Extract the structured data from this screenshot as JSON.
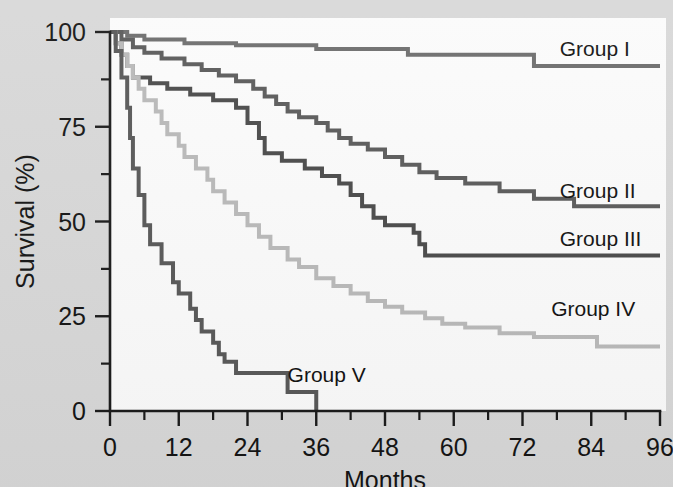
{
  "figure": {
    "background_color": "#d8d8d8",
    "plot_background_color": "#fbfbfb",
    "axis_color": "#1a1a1a"
  },
  "chart_data": {
    "type": "line",
    "subtype": "kaplan-meier-step",
    "title": "",
    "xlabel": "Months",
    "ylabel": "Survival (%)",
    "xlim": [
      0,
      96
    ],
    "ylim": [
      0,
      100
    ],
    "grid": false,
    "legend_position": "inline-right",
    "x_ticks_major": [
      0,
      12,
      24,
      36,
      48,
      60,
      72,
      84,
      96
    ],
    "x_ticks_minor": [
      6,
      18,
      30,
      42,
      54,
      66,
      78,
      90
    ],
    "y_ticks_major": [
      0,
      25,
      50,
      75,
      100
    ],
    "y_ticks_minor": [
      12.5,
      37.5,
      62.5,
      87.5
    ],
    "x_tick_labels": [
      "0",
      "12",
      "24",
      "36",
      "48",
      "60",
      "72",
      "84",
      "96"
    ],
    "y_tick_labels": [
      "0",
      "25",
      "50",
      "75",
      "100"
    ],
    "series": [
      {
        "name": "Group I",
        "label": "Group I",
        "color": "#6d6d6d",
        "line_width": 4.0,
        "label_x": 78.5,
        "label_y": 95.5,
        "final_value": 91,
        "points": [
          [
            0,
            100
          ],
          [
            3,
            100
          ],
          [
            3,
            99
          ],
          [
            6,
            99
          ],
          [
            6,
            98
          ],
          [
            13,
            98
          ],
          [
            13,
            97
          ],
          [
            22,
            97
          ],
          [
            22,
            96.5
          ],
          [
            36,
            96.5
          ],
          [
            36,
            95.5
          ],
          [
            52,
            95.5
          ],
          [
            52,
            94
          ],
          [
            74,
            94
          ],
          [
            74,
            91
          ],
          [
            96,
            91
          ]
        ]
      },
      {
        "name": "Group II",
        "label": "Group II",
        "color": "#5a5a5a",
        "line_width": 4.0,
        "label_x": 78.5,
        "label_y": 58,
        "final_value": 54,
        "points": [
          [
            0,
            100
          ],
          [
            2,
            100
          ],
          [
            2,
            98
          ],
          [
            4,
            98
          ],
          [
            4,
            96
          ],
          [
            6,
            96
          ],
          [
            6,
            94.5
          ],
          [
            9,
            94.5
          ],
          [
            9,
            93
          ],
          [
            13,
            93
          ],
          [
            13,
            91.5
          ],
          [
            16,
            91.5
          ],
          [
            16,
            90
          ],
          [
            19,
            90
          ],
          [
            19,
            88.5
          ],
          [
            22,
            88.5
          ],
          [
            22,
            87
          ],
          [
            25,
            87
          ],
          [
            25,
            85
          ],
          [
            27,
            85
          ],
          [
            27,
            83
          ],
          [
            29,
            83
          ],
          [
            29,
            81
          ],
          [
            31,
            81
          ],
          [
            31,
            79
          ],
          [
            33,
            79
          ],
          [
            33,
            77.5
          ],
          [
            36,
            77.5
          ],
          [
            36,
            76
          ],
          [
            38,
            76
          ],
          [
            38,
            74
          ],
          [
            40,
            74
          ],
          [
            40,
            72
          ],
          [
            42,
            72
          ],
          [
            42,
            70.5
          ],
          [
            45,
            70.5
          ],
          [
            45,
            69
          ],
          [
            48,
            69
          ],
          [
            48,
            67
          ],
          [
            51,
            67
          ],
          [
            51,
            65
          ],
          [
            54,
            65
          ],
          [
            54,
            63
          ],
          [
            57,
            63
          ],
          [
            57,
            61.5
          ],
          [
            62,
            61.5
          ],
          [
            62,
            60
          ],
          [
            68,
            60
          ],
          [
            68,
            58
          ],
          [
            74,
            58
          ],
          [
            74,
            56
          ],
          [
            81,
            56
          ],
          [
            81,
            54
          ],
          [
            96,
            54
          ]
        ]
      },
      {
        "name": "Group III",
        "label": "Group III",
        "color": "#4a4a4a",
        "line_width": 4.0,
        "label_x": 78.5,
        "label_y": 45.5,
        "final_value": 41,
        "points": [
          [
            0,
            100
          ],
          [
            1,
            100
          ],
          [
            1,
            97
          ],
          [
            2,
            97
          ],
          [
            2,
            94
          ],
          [
            3,
            94
          ],
          [
            3,
            91
          ],
          [
            4,
            91
          ],
          [
            4,
            88
          ],
          [
            7,
            88
          ],
          [
            7,
            86.5
          ],
          [
            10,
            86.5
          ],
          [
            10,
            85
          ],
          [
            14,
            85
          ],
          [
            14,
            83.5
          ],
          [
            18,
            83.5
          ],
          [
            18,
            82
          ],
          [
            22,
            82
          ],
          [
            22,
            80
          ],
          [
            24,
            80
          ],
          [
            24,
            76
          ],
          [
            26,
            76
          ],
          [
            26,
            72
          ],
          [
            27,
            72
          ],
          [
            27,
            68
          ],
          [
            30,
            68
          ],
          [
            30,
            66
          ],
          [
            34,
            66
          ],
          [
            34,
            64
          ],
          [
            37,
            64
          ],
          [
            37,
            62
          ],
          [
            40,
            62
          ],
          [
            40,
            60
          ],
          [
            42,
            60
          ],
          [
            42,
            57
          ],
          [
            44,
            57
          ],
          [
            44,
            54
          ],
          [
            46,
            54
          ],
          [
            46,
            51
          ],
          [
            48,
            51
          ],
          [
            48,
            49
          ],
          [
            53,
            49
          ],
          [
            53,
            47
          ],
          [
            54,
            47
          ],
          [
            54,
            44
          ],
          [
            55,
            44
          ],
          [
            55,
            41
          ],
          [
            96,
            41
          ]
        ]
      },
      {
        "name": "Group IV",
        "label": "Group IV",
        "color": "#b9b9b9",
        "line_width": 4.0,
        "label_x": 77,
        "label_y": 27,
        "final_value": 17,
        "points": [
          [
            0,
            100
          ],
          [
            1,
            100
          ],
          [
            1,
            97
          ],
          [
            2,
            97
          ],
          [
            2,
            94
          ],
          [
            3,
            94
          ],
          [
            3,
            91
          ],
          [
            4,
            91
          ],
          [
            4,
            88
          ],
          [
            5,
            88
          ],
          [
            5,
            85
          ],
          [
            6,
            85
          ],
          [
            6,
            82
          ],
          [
            8,
            82
          ],
          [
            8,
            79
          ],
          [
            9,
            79
          ],
          [
            9,
            76
          ],
          [
            10,
            76
          ],
          [
            10,
            73
          ],
          [
            12,
            73
          ],
          [
            12,
            70
          ],
          [
            13,
            70
          ],
          [
            13,
            67
          ],
          [
            15,
            67
          ],
          [
            15,
            64
          ],
          [
            17,
            64
          ],
          [
            17,
            61
          ],
          [
            18,
            61
          ],
          [
            18,
            58
          ],
          [
            20,
            58
          ],
          [
            20,
            55
          ],
          [
            22,
            55
          ],
          [
            22,
            52
          ],
          [
            24,
            52
          ],
          [
            24,
            49
          ],
          [
            26,
            49
          ],
          [
            26,
            46
          ],
          [
            28,
            46
          ],
          [
            28,
            43
          ],
          [
            31,
            43
          ],
          [
            31,
            40
          ],
          [
            33,
            40
          ],
          [
            33,
            38
          ],
          [
            36,
            38
          ],
          [
            36,
            35
          ],
          [
            39,
            35
          ],
          [
            39,
            33
          ],
          [
            42,
            33
          ],
          [
            42,
            31
          ],
          [
            45,
            31
          ],
          [
            45,
            29
          ],
          [
            48,
            29
          ],
          [
            48,
            27.5
          ],
          [
            51,
            27.5
          ],
          [
            51,
            26
          ],
          [
            55,
            26
          ],
          [
            55,
            24.5
          ],
          [
            58,
            24.5
          ],
          [
            58,
            23
          ],
          [
            62,
            23
          ],
          [
            62,
            22
          ],
          [
            68,
            22
          ],
          [
            68,
            20.5
          ],
          [
            74,
            20.5
          ],
          [
            74,
            19.5
          ],
          [
            85,
            19.5
          ],
          [
            85,
            17
          ],
          [
            96,
            17
          ]
        ]
      },
      {
        "name": "Group V",
        "label": "Group V",
        "color": "#585858",
        "line_width": 4.0,
        "label_x": 31,
        "label_y": 9.5,
        "final_value": 5,
        "points": [
          [
            0,
            100
          ],
          [
            1,
            100
          ],
          [
            1,
            95
          ],
          [
            2,
            95
          ],
          [
            2,
            88
          ],
          [
            3,
            88
          ],
          [
            3,
            80
          ],
          [
            3.5,
            80
          ],
          [
            3.5,
            72
          ],
          [
            4,
            72
          ],
          [
            4,
            64
          ],
          [
            5,
            64
          ],
          [
            5,
            57
          ],
          [
            6,
            57
          ],
          [
            6,
            49
          ],
          [
            7,
            49
          ],
          [
            7,
            44
          ],
          [
            9,
            44
          ],
          [
            9,
            39
          ],
          [
            11,
            39
          ],
          [
            11,
            34
          ],
          [
            12,
            34
          ],
          [
            12,
            31
          ],
          [
            14,
            31
          ],
          [
            14,
            27
          ],
          [
            15,
            27
          ],
          [
            15,
            24
          ],
          [
            16,
            24
          ],
          [
            16,
            21
          ],
          [
            18,
            21
          ],
          [
            18,
            18
          ],
          [
            19,
            18
          ],
          [
            19,
            15
          ],
          [
            20,
            15
          ],
          [
            20,
            13
          ],
          [
            22,
            13
          ],
          [
            22,
            10
          ],
          [
            31,
            10
          ],
          [
            31,
            5
          ],
          [
            36,
            5
          ],
          [
            36,
            0
          ]
        ]
      }
    ]
  }
}
